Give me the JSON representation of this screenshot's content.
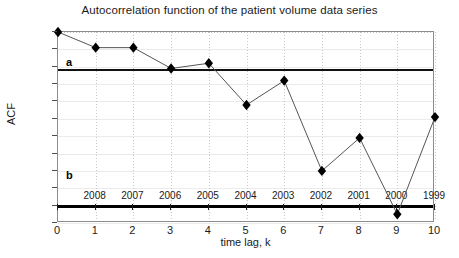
{
  "chart_data": {
    "type": "line",
    "title": "Autocorrelation function of the patient volume data series",
    "xlabel": "time lag, k",
    "ylabel": "ACF",
    "x": [
      0,
      1,
      2,
      3,
      4,
      5,
      6,
      7,
      8,
      9,
      10
    ],
    "values": [
      1.0,
      0.91,
      0.91,
      0.79,
      0.82,
      0.58,
      0.72,
      0.2,
      0.39,
      -0.05,
      0.51
    ],
    "series": [
      {
        "name": "ACF",
        "values": [
          1.0,
          0.91,
          0.91,
          0.79,
          0.82,
          0.58,
          0.72,
          0.2,
          0.39,
          -0.05,
          0.51
        ]
      }
    ],
    "xlim": [
      0,
      10
    ],
    "ylim": [
      -0.1,
      1.0
    ],
    "xticks": [
      "0",
      "1",
      "2",
      "3",
      "4",
      "5",
      "6",
      "7",
      "8",
      "9",
      "10"
    ],
    "yticks": [
      "1",
      "0.9",
      "0.8",
      "0.7",
      "0.6",
      "0.5",
      "0.4",
      "0.3",
      "0.2",
      "0.1",
      "0",
      "-0.1"
    ],
    "ytick_values": [
      1,
      0.9,
      0.8,
      0.7,
      0.6,
      0.5,
      0.4,
      0.3,
      0.2,
      0.1,
      0,
      -0.1
    ],
    "grid": true,
    "legend": "none",
    "marker": "diamond",
    "annotations": [
      {
        "label": "a",
        "kind": "threshold-line",
        "y": 0.78,
        "note": "horizontal reference line a"
      },
      {
        "label": "b",
        "kind": "text",
        "y": 0.17,
        "x": 0.15,
        "note": "label b near zero axis"
      }
    ],
    "reference_lines": [
      {
        "name": "a",
        "y": 0.78
      },
      {
        "name": "zero",
        "y": 0.0
      }
    ],
    "point_labels": {
      "note": "calendar years annotated above the x-axis for lags 1..10",
      "lags": [
        1,
        2,
        3,
        4,
        5,
        6,
        7,
        8,
        9,
        10
      ],
      "years": [
        "2008",
        "2007",
        "2006",
        "2005",
        "2004",
        "2003",
        "2002",
        "2001",
        "2000",
        "1999"
      ]
    },
    "colors": {
      "line": "#555555",
      "marker": "#000000",
      "threshold": "#111111",
      "zero_axis": "#000000",
      "grid": "#e6e6e6",
      "frame": "#8c8c8c"
    }
  }
}
